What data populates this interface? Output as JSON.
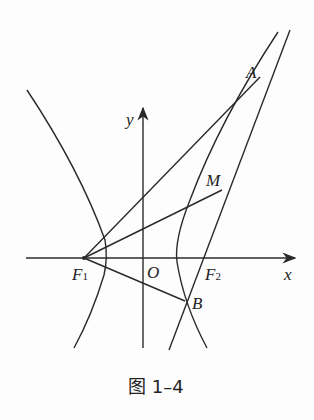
{
  "figure": {
    "caption": "图 1–4",
    "labels": {
      "A": "A",
      "M": "M",
      "B": "B",
      "O": "O",
      "F1": "F",
      "F1_sub": "1",
      "F2": "F",
      "F2_sub": "2",
      "x": "x",
      "y": "y"
    },
    "stroke_color": "#2a2a2a"
  }
}
